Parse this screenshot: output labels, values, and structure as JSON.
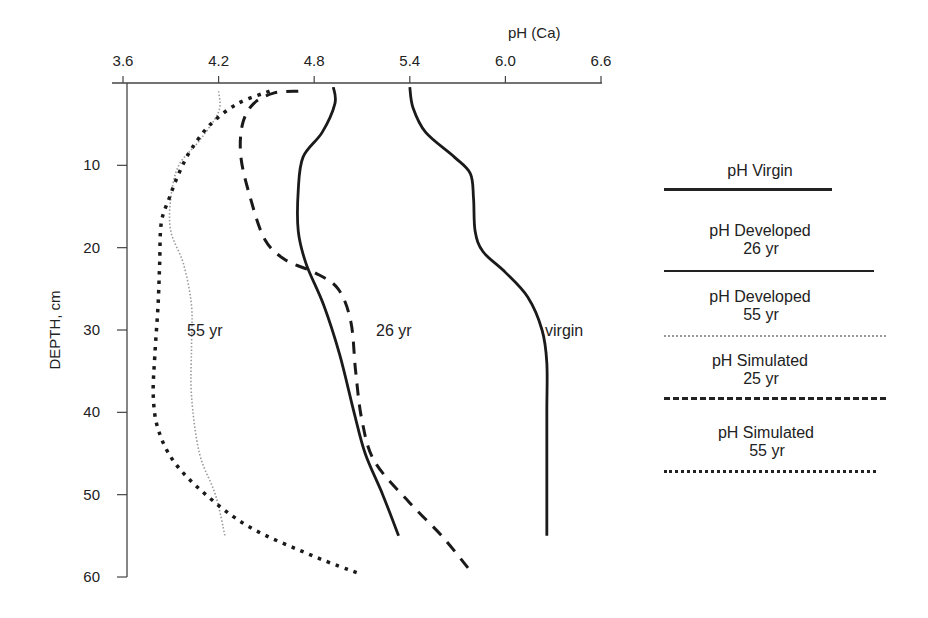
{
  "chart_data": {
    "type": "line",
    "title": "",
    "xlabel": "pH (Ca)",
    "ylabel": "DEPTH, cm",
    "x_axis_position": "top",
    "y_axis_inverted": true,
    "xlim": [
      3.6,
      6.6
    ],
    "ylim": [
      0,
      60
    ],
    "x_ticks": [
      "3.6",
      "4.2",
      "4.8",
      "5.4",
      "6.0",
      "6.6"
    ],
    "y_ticks": [
      "10",
      "20",
      "30",
      "40",
      "50",
      "60"
    ],
    "grid": false,
    "legend_position": "right",
    "series": [
      {
        "name": "pH Virgin",
        "style": "solid",
        "points": [
          [
            5.4,
            0.5
          ],
          [
            5.42,
            3
          ],
          [
            5.5,
            6
          ],
          [
            5.68,
            9
          ],
          [
            5.78,
            11
          ],
          [
            5.8,
            14
          ],
          [
            5.81,
            18
          ],
          [
            5.86,
            20.5
          ],
          [
            6.0,
            23
          ],
          [
            6.14,
            26
          ],
          [
            6.23,
            30
          ],
          [
            6.26,
            34
          ],
          [
            6.26,
            40
          ],
          [
            6.26,
            48
          ],
          [
            6.26,
            55
          ]
        ]
      },
      {
        "name": "pH Developed 26 yr",
        "style": "solid",
        "points": [
          [
            4.92,
            0.5
          ],
          [
            4.93,
            2.5
          ],
          [
            4.85,
            6
          ],
          [
            4.73,
            9
          ],
          [
            4.7,
            13
          ],
          [
            4.7,
            18
          ],
          [
            4.75,
            22
          ],
          [
            4.86,
            27
          ],
          [
            4.96,
            33
          ],
          [
            5.05,
            40
          ],
          [
            5.12,
            45
          ],
          [
            5.23,
            50
          ],
          [
            5.33,
            55
          ]
        ]
      },
      {
        "name": "pH Developed 55 yr",
        "style": "dotted-grey",
        "points": [
          [
            4.2,
            1
          ],
          [
            4.2,
            3.5
          ],
          [
            4.08,
            7
          ],
          [
            3.95,
            10
          ],
          [
            3.9,
            14
          ],
          [
            3.9,
            18
          ],
          [
            3.98,
            22
          ],
          [
            4.03,
            27
          ],
          [
            4.03,
            32
          ],
          [
            4.03,
            38
          ],
          [
            4.08,
            45
          ],
          [
            4.18,
            50
          ],
          [
            4.24,
            55
          ]
        ]
      },
      {
        "name": "pH Simulated 25 yr",
        "style": "dashed",
        "points": [
          [
            4.7,
            1
          ],
          [
            4.55,
            1.2
          ],
          [
            4.42,
            2.5
          ],
          [
            4.35,
            5
          ],
          [
            4.34,
            9
          ],
          [
            4.4,
            14
          ],
          [
            4.49,
            19
          ],
          [
            4.62,
            21.5
          ],
          [
            4.8,
            23
          ],
          [
            4.95,
            25
          ],
          [
            5.03,
            29
          ],
          [
            5.06,
            35
          ],
          [
            5.1,
            41
          ],
          [
            5.18,
            46
          ],
          [
            5.4,
            51
          ],
          [
            5.6,
            55
          ],
          [
            5.77,
            59
          ]
        ]
      },
      {
        "name": "pH Simulated 55 yr",
        "style": "dotted",
        "points": [
          [
            4.52,
            1
          ],
          [
            4.32,
            2.5
          ],
          [
            4.15,
            5
          ],
          [
            4.03,
            8
          ],
          [
            3.95,
            11
          ],
          [
            3.89,
            14
          ],
          [
            3.84,
            17
          ],
          [
            3.83,
            22
          ],
          [
            3.82,
            27
          ],
          [
            3.8,
            33
          ],
          [
            3.79,
            38
          ],
          [
            3.82,
            42
          ],
          [
            3.92,
            46
          ],
          [
            4.12,
            50
          ],
          [
            4.4,
            54
          ],
          [
            4.8,
            57.5
          ],
          [
            5.07,
            59.5
          ]
        ]
      }
    ],
    "annotations": [
      {
        "text": "55 yr",
        "x": 4.02,
        "y": 30
      },
      {
        "text": "26 yr",
        "x": 4.95,
        "y": 30
      },
      {
        "text": "virgin",
        "x": 5.78,
        "y": 30
      }
    ]
  },
  "axes": {
    "x_title": "pH (Ca)",
    "y_title": "DEPTH, cm",
    "x_ticks": [
      "3.6",
      "4.2",
      "4.8",
      "5.4",
      "6.0",
      "6.6"
    ],
    "y_ticks": [
      "10",
      "20",
      "30",
      "40",
      "50",
      "60"
    ]
  },
  "annotations": {
    "a55": "55 yr",
    "a26": "26 yr",
    "virgin": "virgin"
  },
  "legend": {
    "items": [
      {
        "label": "pH Virgin",
        "sub": ""
      },
      {
        "label": "pH Developed",
        "sub": "26 yr"
      },
      {
        "label": "pH Developed",
        "sub": "55 yr"
      },
      {
        "label": "pH Simulated",
        "sub": "25 yr"
      },
      {
        "label": "pH Simulated",
        "sub": "55 yr"
      }
    ]
  }
}
